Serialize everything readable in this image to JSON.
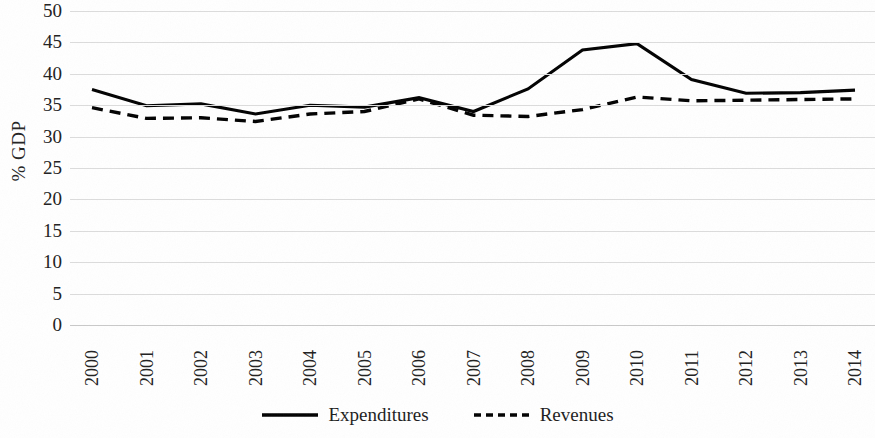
{
  "chart_data": {
    "type": "line",
    "title": "",
    "xlabel": "",
    "ylabel": "% GDP",
    "categories": [
      "2000",
      "2001",
      "2002",
      "2003",
      "2004",
      "2005",
      "2006",
      "2007",
      "2008",
      "2009",
      "2010",
      "2011",
      "2012",
      "2013",
      "2014"
    ],
    "x": [
      2000,
      2001,
      2002,
      2003,
      2004,
      2005,
      2006,
      2007,
      2008,
      2009,
      2010,
      2011,
      2012,
      2013,
      2014
    ],
    "series": [
      {
        "name": "Expenditures",
        "style": "solid",
        "color": "#000000",
        "values": [
          37.5,
          34.9,
          35.2,
          33.6,
          35.0,
          34.7,
          36.2,
          34.0,
          37.6,
          43.8,
          44.8,
          39.1,
          36.9,
          37.0,
          37.4
        ]
      },
      {
        "name": "Revenues",
        "style": "dashed",
        "color": "#000000",
        "values": [
          34.6,
          32.9,
          33.0,
          32.4,
          33.6,
          34.0,
          36.0,
          33.4,
          33.2,
          34.3,
          36.3,
          35.7,
          35.8,
          35.9,
          36.0
        ]
      }
    ],
    "ylim": [
      0,
      50
    ],
    "ytick_step": 5,
    "yticks": [
      "50",
      "45",
      "40",
      "35",
      "30",
      "25",
      "20",
      "15",
      "10",
      "5",
      "0"
    ],
    "grid": true,
    "legend_position": "bottom-center",
    "legend": [
      {
        "label": "Expenditures",
        "style": "solid"
      },
      {
        "label": "Revenues",
        "style": "dashed"
      }
    ]
  },
  "axis": {
    "y_title": "% GDP"
  }
}
